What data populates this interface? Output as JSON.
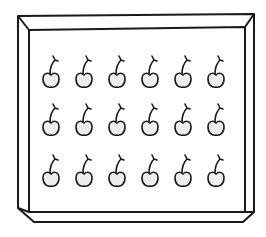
{
  "illustration": {
    "subject": "tray of cherries",
    "stroke_color": "#1a1a1a",
    "fill_color": "#eeeeee",
    "background": "#ffffff"
  },
  "tray": {
    "outer": [
      [
        18,
        16
      ],
      [
        254,
        14
      ],
      [
        254,
        212
      ],
      [
        243,
        222
      ],
      [
        34,
        222
      ],
      [
        18,
        208
      ]
    ],
    "inner": [
      [
        29,
        30
      ],
      [
        245,
        27
      ],
      [
        245,
        212
      ],
      [
        29,
        212
      ]
    ]
  },
  "cherries": {
    "rows": 3,
    "cols": 6,
    "count": 18,
    "col_x": [
      51,
      84,
      117,
      150,
      183,
      216
    ],
    "row_y": [
      80,
      128,
      179
    ]
  }
}
